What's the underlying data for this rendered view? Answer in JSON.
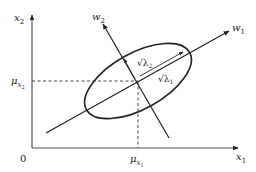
{
  "diagram": {
    "type": "pca-gaussian-ellipse",
    "colors": {
      "stroke": "#222222",
      "background": "#ffffff"
    },
    "axes": {
      "x_label": "x",
      "x_label_sub": "1",
      "y_label": "x",
      "y_label_sub": "2",
      "origin_label": "0"
    },
    "means": {
      "mu_x1_symbol": "μ",
      "mu_x1_sub": "x",
      "mu_x1_subsub": "1",
      "mu_x2_symbol": "μ",
      "mu_x2_sub": "x",
      "mu_x2_subsub": "2"
    },
    "eigenvectors": [
      {
        "label": "w",
        "sub": "1"
      },
      {
        "label": "w",
        "sub": "2"
      }
    ],
    "eigenvalues": [
      {
        "label": "√λ",
        "sub": "1"
      },
      {
        "label": "√λ",
        "sub": "2"
      }
    ]
  }
}
